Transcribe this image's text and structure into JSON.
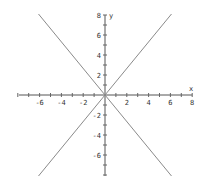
{
  "chart_data": {
    "type": "line",
    "title": "",
    "xlabel": "x",
    "ylabel": "y",
    "xlim": [
      -8,
      8
    ],
    "ylim": [
      -8,
      8
    ],
    "grid": false,
    "x_tick_labels": [
      "-6",
      "-4",
      "-2",
      "2",
      "4",
      "6",
      "8"
    ],
    "x_tick_values": [
      -6,
      -4,
      -2,
      2,
      4,
      6,
      8
    ],
    "y_tick_labels": [
      "8",
      "6",
      "4",
      "2",
      "-2",
      "-4",
      "-6"
    ],
    "y_tick_values": [
      8,
      6,
      4,
      2,
      -2,
      -4,
      -6
    ],
    "minor_tick_step": 1,
    "series": [
      {
        "name": "line-positive-slope",
        "equation": "y = 4x/3",
        "x": [
          -6.1,
          6.1
        ],
        "y": [
          -8.1,
          8.1
        ]
      },
      {
        "name": "line-negative-slope",
        "equation": "y = -4x/3",
        "x": [
          -6.1,
          6.1
        ],
        "y": [
          8.1,
          -8.1
        ]
      }
    ],
    "colors": {
      "axis": "#555555",
      "series": "#8a8a8a"
    }
  }
}
